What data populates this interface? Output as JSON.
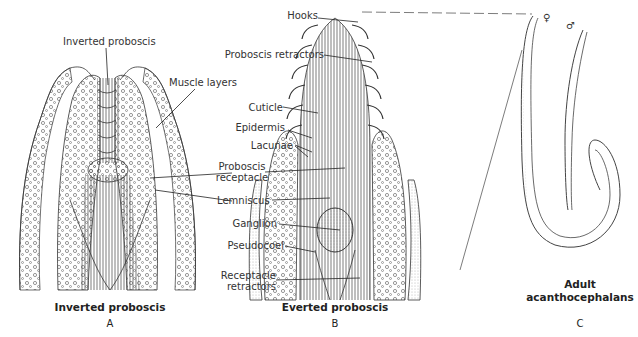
{
  "figure": {
    "panels": [
      {
        "id": "A",
        "caption": "Inverted proboscis",
        "letter": "A",
        "labels": {
          "inverted_proboscis": "Inverted proboscis",
          "muscle_layers": "Muscle layers"
        }
      },
      {
        "id": "B",
        "caption": "Everted proboscis",
        "letter": "B",
        "labels": {
          "hooks": "Hooks",
          "proboscis_retractors": "Proboscis retractors",
          "cuticle": "Cuticle",
          "epidermis": "Epidermis",
          "lacunae": "Lacunae",
          "proboscis_receptacle_1": "Proboscis",
          "proboscis_receptacle_2": "receptacle",
          "lemniscus": "Lemniscus",
          "ganglion": "Ganglion",
          "pseudocoel": "Pseudocoel",
          "receptacle_retractors_1": "Receptacle",
          "receptacle_retractors_2": "retractors"
        }
      },
      {
        "id": "C",
        "caption_line1": "Adult",
        "caption_line2": "acanthocephalans",
        "letter": "C",
        "labels": {
          "female": "♀",
          "male": "♂"
        }
      }
    ]
  }
}
